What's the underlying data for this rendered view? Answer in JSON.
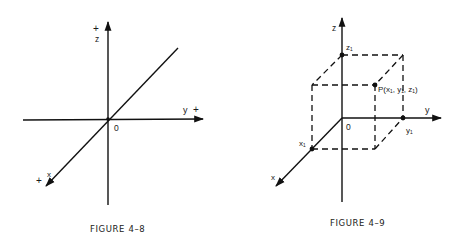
{
  "figures": [
    {
      "id": "figure-4-8",
      "caption": "FIGURE 4–8",
      "labels": {
        "z_axis": "z",
        "z_plus": "+",
        "y_axis": "y",
        "y_plus": "+",
        "x_axis": "x",
        "x_plus": "+",
        "origin": "0"
      }
    },
    {
      "id": "figure-4-9",
      "caption": "FIGURE 4–9",
      "labels": {
        "z_axis": "z",
        "y_axis": "y",
        "x_axis": "x",
        "origin": "0",
        "z1": "z₁",
        "y1": "y₁",
        "x1": "x₁",
        "point_p": "P(x₁, y₁, z₁)"
      }
    }
  ]
}
